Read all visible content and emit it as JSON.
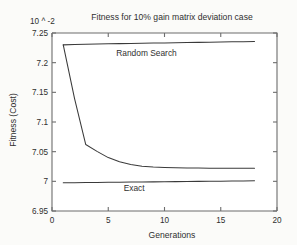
{
  "chart_data": {
    "type": "line",
    "title": "Fitness for 10% gain matrix deviation case",
    "xlabel": "Generations",
    "ylabel": "Fitness (Cost)",
    "y_exponent_label": "10 ^ -2",
    "xlim": [
      0,
      20
    ],
    "ylim": [
      6.95,
      7.25
    ],
    "xticks": [
      0,
      5,
      10,
      15,
      20
    ],
    "xtick_labels": [
      "0",
      "5",
      "10",
      "15",
      "20"
    ],
    "yticks": [
      6.95,
      7.0,
      7.05,
      7.1,
      7.15,
      7.2,
      7.25
    ],
    "ytick_labels": [
      "6.95",
      "7",
      "7.05",
      "7.1",
      "7.15",
      "7.2",
      "7.25"
    ],
    "grid": false,
    "legend": "inline-annotations",
    "annotations": [
      {
        "text": "Random Search",
        "x": 8.4,
        "y": 7.212
      },
      {
        "text": "Exact",
        "x": 7.3,
        "y": 6.983
      }
    ],
    "series": [
      {
        "name": "Random Search",
        "x": [
          1,
          2,
          3,
          4,
          5,
          6,
          7,
          8,
          9,
          10,
          11,
          12,
          13,
          14,
          15,
          16,
          17,
          18
        ],
        "values": [
          7.23,
          7.2305,
          7.231,
          7.2314,
          7.2318,
          7.2321,
          7.2324,
          7.2327,
          7.233,
          7.2333,
          7.2336,
          7.2339,
          7.2342,
          7.2345,
          7.2348,
          7.2351,
          7.2354,
          7.2358
        ]
      },
      {
        "name": "Genetic Algorithm",
        "x": [
          1,
          2,
          3,
          4,
          5,
          6,
          7,
          8,
          9,
          10,
          11,
          12,
          13,
          14,
          15,
          16,
          17,
          18
        ],
        "values": [
          7.23,
          7.14,
          7.062,
          7.0505,
          7.04,
          7.033,
          7.0285,
          7.0255,
          7.024,
          7.0232,
          7.0228,
          7.0225,
          7.0223,
          7.0222,
          7.0221,
          7.022,
          7.022,
          7.022
        ]
      },
      {
        "name": "Exact",
        "x": [
          1,
          2,
          3,
          4,
          5,
          6,
          7,
          8,
          9,
          10,
          11,
          12,
          13,
          14,
          15,
          16,
          17,
          18
        ],
        "values": [
          6.9975,
          6.9977,
          6.9979,
          6.9981,
          6.9983,
          6.9985,
          6.9987,
          6.9989,
          6.9991,
          6.9993,
          6.9995,
          6.9997,
          6.9999,
          7.0001,
          7.0003,
          7.0005,
          7.0007,
          7.001
        ]
      }
    ]
  }
}
